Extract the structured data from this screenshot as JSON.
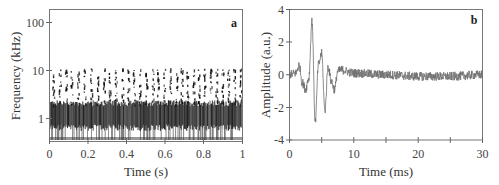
{
  "chart_data": [
    {
      "panel": "a",
      "type": "heatmap",
      "title": "",
      "xlabel": "Time (s)",
      "ylabel": "Frequency (kHz)",
      "xlim": [
        0,
        1
      ],
      "ylim": [
        0.35,
        200
      ],
      "yscale": "log",
      "xticks": [
        "0",
        "0.2",
        "0.4",
        "0.6",
        "0.8",
        "1"
      ],
      "yticks": [
        "1",
        "10",
        "100"
      ],
      "grid": false,
      "description": "Spectrogram-like scatter: dense dark band around 0.5–2 kHz across full time range; periodic vertical striations of sparser points between ~2 and ~10 kHz; repeating bursts roughly every 0.02–0.03 s"
    },
    {
      "panel": "b",
      "type": "line",
      "title": "",
      "xlabel": "Time (ms)",
      "ylabel": "Amplitude (a.u.)",
      "xlim": [
        0,
        30
      ],
      "ylim": [
        -4,
        4
      ],
      "xticks": [
        "0",
        "10",
        "20",
        "30"
      ],
      "yticks": [
        "-4",
        "-2",
        "0",
        "2",
        "4"
      ],
      "grid": false,
      "x": [
        0,
        1,
        1.5,
        2,
        2.5,
        3,
        3.5,
        4,
        4.5,
        5,
        5.5,
        6,
        6.5,
        7,
        7.5,
        8,
        10,
        15,
        20,
        25,
        30
      ],
      "values": [
        0,
        0.1,
        0.6,
        -0.5,
        -0.9,
        -0.2,
        3.3,
        -2.9,
        0.6,
        1.3,
        -2.2,
        0.5,
        -0.4,
        -0.9,
        0.2,
        0.3,
        0.1,
        0.0,
        -0.1,
        -0.1,
        0.0
      ],
      "series_color": "#707070"
    }
  ],
  "panel_a": {
    "label": "a",
    "ylabel": "Frequency (kHz)",
    "xlabel": "Time (s)",
    "yticks": [
      "100",
      "10",
      "1"
    ],
    "xticks": [
      "0",
      "0.2",
      "0.4",
      "0.6",
      "0.8",
      "1"
    ]
  },
  "panel_b": {
    "label": "b",
    "ylabel": "Amplitude (a.u.)",
    "xlabel": "Time (ms)",
    "yticks": [
      "4",
      "2",
      "0",
      "-2",
      "-4"
    ],
    "xticks": [
      "0",
      "10",
      "20",
      "30"
    ]
  }
}
